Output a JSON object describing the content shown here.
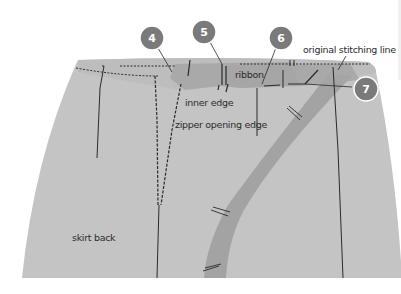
{
  "diagram": {
    "labels": {
      "inner_edge": "inner edge",
      "zipper_opening_edge": "zipper opening edge",
      "ribbon": "ribbon",
      "original_stitching_line": "original stitching line",
      "skirt_back": "skirt back"
    },
    "callouts": [
      {
        "number": "4",
        "target": "waistband left of zipper"
      },
      {
        "number": "5",
        "target": "zipper top stop"
      },
      {
        "number": "6",
        "target": "ribbon"
      },
      {
        "number": "7",
        "target": "ribbon end stitching"
      }
    ],
    "colors": {
      "skirt_fill": "#c4c4c4",
      "waistband_fill": "#b4b4b4",
      "ribbon_fill": "#a6a6a6",
      "badge_fill": "#7a7a7a",
      "badge_stroke": "#ffffff",
      "stitch_color": "#2a2a2a",
      "text_color": "#2b2b2b",
      "background": "#ffffff"
    }
  }
}
